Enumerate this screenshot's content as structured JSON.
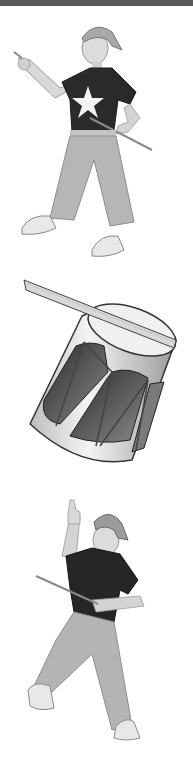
{
  "page": {
    "top_band_color": "#5a5a5a",
    "background": "#ffffff"
  },
  "illustrations": [
    {
      "id": "boy-pointing",
      "description": "Boy in backwards cap and star t-shirt pointing, holding a drumstick"
    },
    {
      "id": "drum",
      "description": "Snare-style drum with a drumstick across the top"
    },
    {
      "id": "boy-thumbs-up",
      "description": "Boy in backwards cap giving a thumbs up, holding a drumstick"
    }
  ]
}
